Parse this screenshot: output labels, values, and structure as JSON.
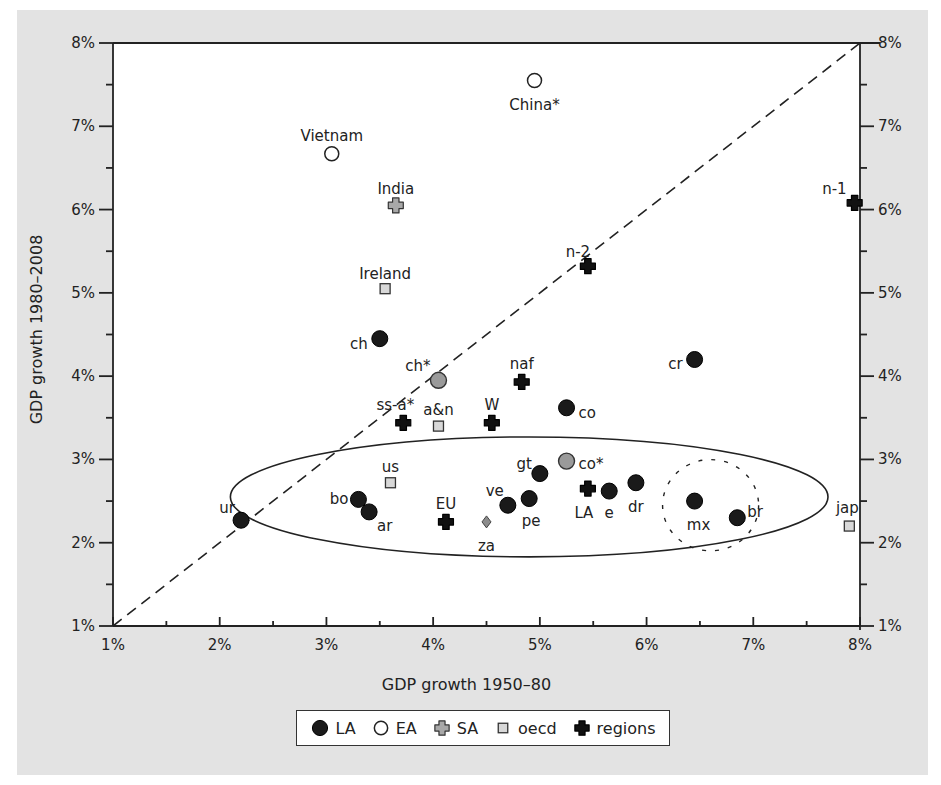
{
  "chart_data": {
    "type": "scatter",
    "title": "",
    "xlabel": "GDP growth 1950–80",
    "ylabel": "GDP growth 1980–2008",
    "xlim": [
      1,
      8
    ],
    "ylim": [
      1,
      8
    ],
    "x_ticks": [
      "1%",
      "2%",
      "3%",
      "4%",
      "5%",
      "6%",
      "7%",
      "8%"
    ],
    "y_ticks": [
      "1%",
      "2%",
      "3%",
      "4%",
      "5%",
      "6%",
      "7%",
      "8%"
    ],
    "grid": false,
    "legend_position": "bottom",
    "reference_line": {
      "style": "dashed",
      "from": [
        1,
        1
      ],
      "to": [
        8,
        8
      ],
      "label": "45-degree line"
    },
    "annotations": [
      {
        "type": "ellipse",
        "style": "solid",
        "center": [
          4.9,
          2.55
        ],
        "rx": 2.8,
        "ry": 0.72
      },
      {
        "type": "circle",
        "style": "dotted",
        "center": [
          6.6,
          2.45
        ],
        "r": 0.45
      }
    ],
    "series": [
      {
        "name": "LA",
        "marker": "filled-circle",
        "color": "#1a1a1a",
        "points": [
          {
            "label": "ch",
            "x": 3.5,
            "y": 4.45
          },
          {
            "label": "co",
            "x": 5.25,
            "y": 3.62
          },
          {
            "label": "cr",
            "x": 6.45,
            "y": 4.2
          },
          {
            "label": "ur",
            "x": 2.2,
            "y": 2.27
          },
          {
            "label": "bo",
            "x": 3.3,
            "y": 2.52
          },
          {
            "label": "ar",
            "x": 3.4,
            "y": 2.37
          },
          {
            "label": "ve",
            "x": 4.7,
            "y": 2.45
          },
          {
            "label": "pe",
            "x": 4.9,
            "y": 2.53
          },
          {
            "label": "gt",
            "x": 5.0,
            "y": 2.83
          },
          {
            "label": "e",
            "x": 5.65,
            "y": 2.62
          },
          {
            "label": "dr",
            "x": 5.9,
            "y": 2.72
          },
          {
            "label": "mx",
            "x": 6.45,
            "y": 2.5
          },
          {
            "label": "br",
            "x": 6.85,
            "y": 2.3
          }
        ]
      },
      {
        "name": "LA (gray)",
        "marker": "gray-circle",
        "color": "#999999",
        "points": [
          {
            "label": "ch*",
            "x": 4.05,
            "y": 3.95
          },
          {
            "label": "co*",
            "x": 5.25,
            "y": 2.98
          }
        ]
      },
      {
        "name": "EA",
        "marker": "open-circle",
        "color": "#ffffff",
        "points": [
          {
            "label": "China*",
            "x": 4.95,
            "y": 7.55
          },
          {
            "label": "Vietnam",
            "x": 3.05,
            "y": 6.67
          }
        ]
      },
      {
        "name": "SA",
        "marker": "gray-cross",
        "color": "#a6a6a6",
        "points": [
          {
            "label": "India",
            "x": 3.65,
            "y": 6.05
          }
        ]
      },
      {
        "name": "oecd",
        "marker": "square",
        "color": "#d6d6d6",
        "points": [
          {
            "label": "Ireland",
            "x": 3.55,
            "y": 5.05
          },
          {
            "label": "a&n",
            "x": 4.05,
            "y": 3.4
          },
          {
            "label": "us",
            "x": 3.6,
            "y": 2.72
          },
          {
            "label": "jap",
            "x": 7.9,
            "y": 2.2
          }
        ]
      },
      {
        "name": "regions",
        "marker": "black-cross",
        "color": "#111111",
        "points": [
          {
            "label": "n-1",
            "x": 7.95,
            "y": 6.08
          },
          {
            "label": "n-2",
            "x": 5.45,
            "y": 5.32
          },
          {
            "label": "naf",
            "x": 4.83,
            "y": 3.93
          },
          {
            "label": "ss-a*",
            "x": 3.72,
            "y": 3.44
          },
          {
            "label": "W",
            "x": 4.55,
            "y": 3.44
          },
          {
            "label": "EU",
            "x": 4.12,
            "y": 2.25
          },
          {
            "label": "LA",
            "x": 5.45,
            "y": 2.65
          }
        ]
      },
      {
        "name": "other",
        "marker": "gray-diamond",
        "color": "#8c8c8c",
        "points": [
          {
            "label": "za",
            "x": 4.5,
            "y": 2.25
          }
        ]
      }
    ]
  },
  "legend": {
    "items": [
      {
        "label": "LA",
        "marker": "filled-circle"
      },
      {
        "label": "EA",
        "marker": "open-circle"
      },
      {
        "label": "SA",
        "marker": "gray-cross"
      },
      {
        "label": "oecd",
        "marker": "square"
      },
      {
        "label": "regions",
        "marker": "black-cross"
      }
    ]
  },
  "colors": {
    "panel_bg": "#e3e3e3",
    "plot_bg": "#ffffff",
    "axis": "#222222"
  }
}
